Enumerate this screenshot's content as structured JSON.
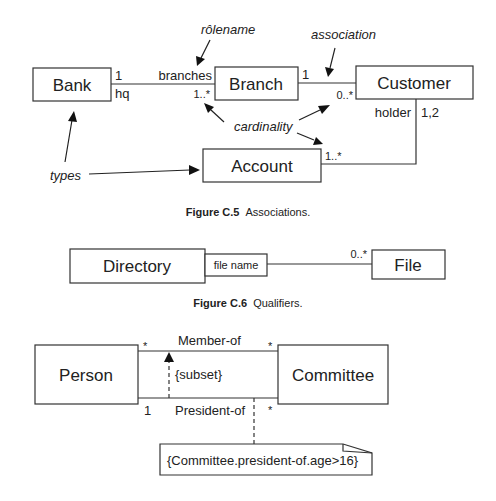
{
  "figure_c5": {
    "caption_number": "Figure C.5",
    "caption_text": "Associations.",
    "classes": {
      "bank": "Bank",
      "branch": "Branch",
      "customer": "Customer",
      "account": "Account"
    },
    "labels": {
      "bank_mult": "1",
      "bank_role": "hq",
      "branch_role": "branches",
      "branch_mult": "1..*",
      "branch_cust_mult": "1",
      "customer_mult": "0..*",
      "holder_role": "holder",
      "holder_mult": "1,2",
      "account_mult": "1..*"
    },
    "annotations": {
      "rolename": "rôlename",
      "association": "association",
      "cardinality": "cardinality",
      "types": "types"
    }
  },
  "figure_c6": {
    "caption_number": "Figure C.6",
    "caption_text": "Qualifiers.",
    "classes": {
      "directory": "Directory",
      "file": "File"
    },
    "qualifier": "file name",
    "file_mult": "0..*"
  },
  "figure_c7": {
    "classes": {
      "person": "Person",
      "committee": "Committee"
    },
    "member_of": "Member-of",
    "president_of": "President-of",
    "subset": "{subset}",
    "constraint": "{Committee.president-of.age>16}",
    "mults": {
      "member_person": "*",
      "member_committee": "*",
      "president_person": "1",
      "president_committee": "*"
    }
  }
}
